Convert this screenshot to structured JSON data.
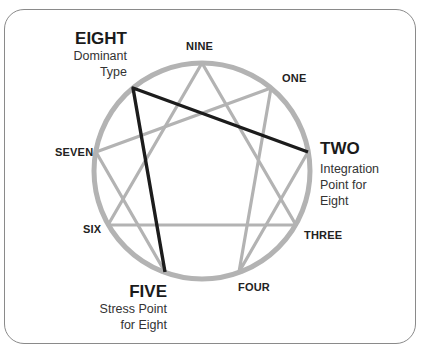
{
  "diagram": {
    "center": [
      202,
      171
    ],
    "radius": 108,
    "colors": {
      "circle": "#b3b3b3",
      "lines": "#b3b3b3",
      "highlight": "#1c1c1c",
      "text": "#222222",
      "frame": "#8a8a8a"
    },
    "points": [
      {
        "id": "nine",
        "label": "NINE"
      },
      {
        "id": "one",
        "label": "ONE"
      },
      {
        "id": "two",
        "label": "TWO"
      },
      {
        "id": "three",
        "label": "THREE"
      },
      {
        "id": "four",
        "label": "FOUR"
      },
      {
        "id": "five",
        "label": "FIVE"
      },
      {
        "id": "six",
        "label": "SIX"
      },
      {
        "id": "seven",
        "label": "SEVEN"
      },
      {
        "id": "eight",
        "label": "EIGHT"
      }
    ],
    "connections": {
      "triangle": [
        "NINE",
        "THREE",
        "SIX"
      ],
      "hexad": [
        "ONE",
        "FOUR",
        "TWO",
        "EIGHT",
        "FIVE",
        "SEVEN"
      ],
      "highlighted": [
        [
          "EIGHT",
          "TWO"
        ],
        [
          "EIGHT",
          "FIVE"
        ]
      ]
    },
    "callouts": {
      "eight": {
        "title": "EIGHT",
        "line1": "Dominant",
        "line2": "Type"
      },
      "two": {
        "title": "TWO",
        "line1": "Integration",
        "line2": "Point for",
        "line3": "Eight"
      },
      "five": {
        "title": "FIVE",
        "line1": "Stress Point",
        "line2": "for Eight"
      }
    }
  }
}
